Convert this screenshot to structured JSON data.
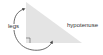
{
  "diagram": {
    "labels": {
      "legs": "legs",
      "hypotenuse": "hypotenuse"
    },
    "colors": {
      "triangle_fill": "#e4e4e4",
      "stroke": "#444444",
      "text": "#333333"
    }
  }
}
